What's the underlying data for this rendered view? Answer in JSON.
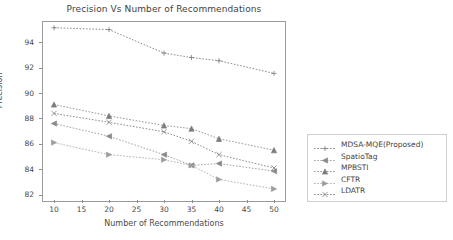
{
  "chart_data": {
    "type": "line",
    "title": "Precision Vs Number of Recommendations",
    "xlabel": "Number of Recommendations",
    "ylabel": "Precision",
    "x": [
      10,
      20,
      30,
      35,
      40,
      50
    ],
    "xticks": [
      10,
      15,
      20,
      25,
      30,
      35,
      40,
      45,
      50
    ],
    "yticks": [
      82,
      84,
      86,
      88,
      90,
      92,
      94
    ],
    "xlim": [
      8,
      52
    ],
    "ylim": [
      81.5,
      95.6
    ],
    "grid": false,
    "legend_position": "right-outside",
    "series": [
      {
        "name": "MDSA-MQE(Proposed)",
        "marker": "plus",
        "linestyle": "dotted",
        "color": "#6e6e6e",
        "values": [
          95.15,
          95.0,
          93.15,
          92.8,
          92.55,
          91.55
        ]
      },
      {
        "name": "SpatioTag",
        "marker": "triangle-left",
        "linestyle": "dotted",
        "color": "#8a8a8a",
        "values": [
          87.6,
          86.6,
          85.15,
          84.3,
          84.45,
          83.85
        ]
      },
      {
        "name": "MPBSTI",
        "marker": "triangle-up",
        "linestyle": "dotted",
        "color": "#7d7d7d",
        "values": [
          89.1,
          88.2,
          87.45,
          87.2,
          86.4,
          85.5
        ]
      },
      {
        "name": "CFTR",
        "marker": "triangle-right",
        "linestyle": "dotted",
        "color": "#9e9e9e",
        "values": [
          86.1,
          85.15,
          84.75,
          84.3,
          83.2,
          82.45
        ]
      },
      {
        "name": "LDATR",
        "marker": "x",
        "linestyle": "dotted",
        "color": "#707070",
        "values": [
          88.4,
          87.7,
          86.95,
          86.2,
          85.15,
          84.1
        ]
      }
    ]
  }
}
